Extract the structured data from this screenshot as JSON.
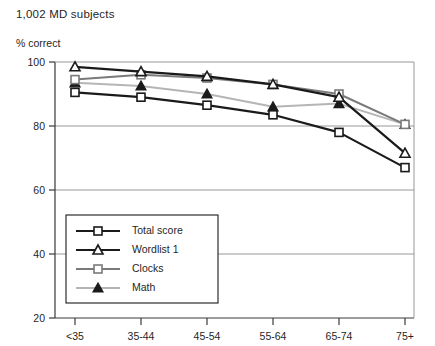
{
  "chart_data": {
    "type": "line",
    "title": "1,002 MD subjects",
    "subtitle": "",
    "xlabel": "",
    "ylabel": "% correct",
    "categories": [
      "<35",
      "35-44",
      "45-54",
      "55-64",
      "65-74",
      "75+"
    ],
    "ylim": [
      20,
      100
    ],
    "yticks": [
      20,
      40,
      60,
      80,
      100
    ],
    "ytick_labels": [
      "20",
      "40",
      "60",
      "80",
      "100"
    ],
    "grid": "horizontal",
    "legend_position": "lower-left-inside",
    "series": [
      {
        "name": "Total score",
        "values": [
          90.5,
          89.0,
          86.5,
          83.5,
          78.0,
          67.0
        ],
        "color": "#1a1a1a",
        "marker": "square-open",
        "line_width": 2.2
      },
      {
        "name": "Wordlist 1",
        "values": [
          98.5,
          97.0,
          95.5,
          93.0,
          89.0,
          71.5
        ],
        "color": "#1a1a1a",
        "marker": "triangle-open",
        "line_width": 2.2
      },
      {
        "name": "Clocks",
        "values": [
          94.5,
          96.0,
          95.0,
          93.0,
          90.0,
          80.5
        ],
        "color": "#7a7a7a",
        "marker": "square-open",
        "line_width": 2.0
      },
      {
        "name": "Math",
        "values": [
          93.5,
          92.5,
          90.0,
          86.0,
          87.0,
          80.5
        ],
        "color": "#b5b5b5",
        "marker": "triangle-filled",
        "line_width": 2.0
      }
    ]
  },
  "colors": {
    "axis": "#3a3a3a",
    "grid": "#8c8c8c",
    "background": "#ffffff",
    "text": "#1f1f1f"
  },
  "legend": {
    "items": [
      "Total score",
      "Wordlist 1",
      "Clocks",
      "Math"
    ]
  }
}
